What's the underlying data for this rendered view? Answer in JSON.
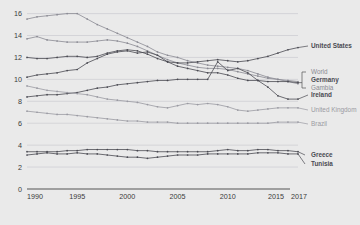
{
  "chart_data": {
    "type": "line",
    "title": "",
    "xlabel": "",
    "ylabel": "",
    "xlim": [
      1990,
      2017
    ],
    "ylim": [
      0,
      16.6
    ],
    "grid": true,
    "legend_position": "right",
    "y_ticks": [
      0,
      2,
      4,
      6,
      8,
      10,
      12,
      14,
      16
    ],
    "x_ticks": [
      1990,
      1995,
      2000,
      2005,
      2010,
      2015,
      2017
    ],
    "x_tick_labels": [
      "1990",
      "1995",
      "2000",
      "2005",
      "2010",
      "2015",
      "2017"
    ],
    "x": [
      1990,
      1991,
      1992,
      1993,
      1994,
      1995,
      1996,
      1997,
      1998,
      1999,
      2000,
      2001,
      2002,
      2003,
      2004,
      2005,
      2006,
      2007,
      2008,
      2009,
      2010,
      2011,
      2012,
      2013,
      2014,
      2015,
      2016,
      2017
    ],
    "series": [
      {
        "name": "Gambia",
        "color": "#8a8a93",
        "label_style": "light",
        "values": [
          15.5,
          15.7,
          15.8,
          15.9,
          16.0,
          16.0,
          15.5,
          15.0,
          14.6,
          14.2,
          13.8,
          13.4,
          13.0,
          12.5,
          12.2,
          12.0,
          11.7,
          11.5,
          11.3,
          11.2,
          11.1,
          11.0,
          10.8,
          10.5,
          10.2,
          10.0,
          9.8,
          9.6
        ]
      },
      {
        "name": "World",
        "color": "#8a8a93",
        "label_style": "light",
        "values": [
          13.7,
          13.9,
          13.6,
          13.5,
          13.4,
          13.4,
          13.4,
          13.5,
          13.6,
          13.5,
          13.3,
          13.0,
          12.6,
          12.2,
          11.8,
          11.5,
          11.3,
          11.1,
          11.0,
          11.0,
          10.9,
          10.7,
          10.5,
          10.3,
          10.1,
          10.0,
          9.9,
          9.8
        ]
      },
      {
        "name": "United States",
        "color": "#4a4a52",
        "label_style": "strong",
        "values": [
          12.0,
          11.9,
          11.9,
          12.0,
          12.1,
          12.1,
          12.0,
          12.1,
          12.4,
          12.6,
          12.7,
          12.6,
          12.3,
          11.9,
          11.6,
          11.5,
          11.5,
          11.6,
          11.7,
          11.8,
          11.7,
          11.6,
          11.7,
          11.9,
          12.1,
          12.4,
          12.7,
          12.9
        ]
      },
      {
        "name": "Germany",
        "color": "#4a4a52",
        "label_style": "strong",
        "values": [
          10.2,
          10.4,
          10.5,
          10.6,
          10.8,
          10.9,
          11.5,
          11.9,
          12.3,
          12.5,
          12.6,
          12.4,
          12.5,
          12.2,
          11.6,
          11.2,
          11.0,
          10.8,
          10.6,
          10.6,
          10.4,
          10.1,
          9.9,
          9.9,
          9.8,
          9.8,
          9.8,
          9.7
        ]
      },
      {
        "name": "Ireland",
        "color": "#4a4a52",
        "label_style": "strong",
        "values": [
          8.4,
          8.5,
          8.6,
          8.6,
          8.7,
          8.8,
          9.0,
          9.2,
          9.3,
          9.5,
          9.6,
          9.7,
          9.8,
          9.9,
          9.9,
          10.0,
          10.0,
          10.0,
          10.0,
          11.6,
          10.8,
          11.0,
          10.6,
          9.9,
          9.3,
          8.5,
          8.2,
          8.2
        ]
      },
      {
        "name": "United Kingdom",
        "color": "#9a9aa2",
        "label_style": "light",
        "values": [
          9.4,
          9.2,
          9.0,
          8.9,
          8.8,
          8.7,
          8.6,
          8.4,
          8.2,
          8.1,
          8.0,
          7.9,
          7.7,
          7.5,
          7.4,
          7.6,
          7.8,
          7.7,
          7.8,
          7.7,
          7.5,
          7.2,
          7.1,
          7.2,
          7.3,
          7.4,
          7.4,
          7.4
        ]
      },
      {
        "name": "Brazil",
        "color": "#9a9aa2",
        "label_style": "light",
        "values": [
          7.1,
          7.0,
          6.9,
          6.8,
          6.8,
          6.7,
          6.6,
          6.5,
          6.4,
          6.3,
          6.2,
          6.2,
          6.1,
          6.1,
          6.1,
          6.0,
          6.0,
          6.0,
          6.0,
          6.0,
          6.0,
          6.0,
          6.0,
          6.0,
          6.0,
          6.1,
          6.1,
          6.1
        ]
      },
      {
        "name": "Greece",
        "color": "#4a4a52",
        "label_style": "strong",
        "values": [
          3.4,
          3.4,
          3.4,
          3.4,
          3.5,
          3.5,
          3.6,
          3.6,
          3.6,
          3.6,
          3.6,
          3.5,
          3.5,
          3.4,
          3.4,
          3.4,
          3.4,
          3.4,
          3.4,
          3.5,
          3.6,
          3.5,
          3.5,
          3.6,
          3.6,
          3.5,
          3.5,
          3.4
        ]
      },
      {
        "name": "Tunisia",
        "color": "#4a4a52",
        "label_style": "strong",
        "values": [
          3.1,
          3.2,
          3.3,
          3.2,
          3.2,
          3.3,
          3.2,
          3.2,
          3.1,
          3.0,
          2.9,
          2.9,
          2.8,
          2.9,
          3.0,
          3.1,
          3.1,
          3.1,
          3.2,
          3.2,
          3.2,
          3.2,
          3.2,
          3.3,
          3.3,
          3.3,
          3.2,
          3.2
        ]
      }
    ],
    "legend_entries": [
      {
        "name": "United States",
        "style": "strong"
      },
      {
        "name": "World",
        "style": "light"
      },
      {
        "name": "Germany",
        "style": "strong"
      },
      {
        "name": "Gambia",
        "style": "light"
      },
      {
        "name": "Ireland",
        "style": "strong"
      },
      {
        "name": "United Kingdom",
        "style": "light"
      },
      {
        "name": "Brazil",
        "style": "light"
      },
      {
        "name": "Greece",
        "style": "strong"
      },
      {
        "name": "Tunisia",
        "style": "strong"
      }
    ]
  }
}
